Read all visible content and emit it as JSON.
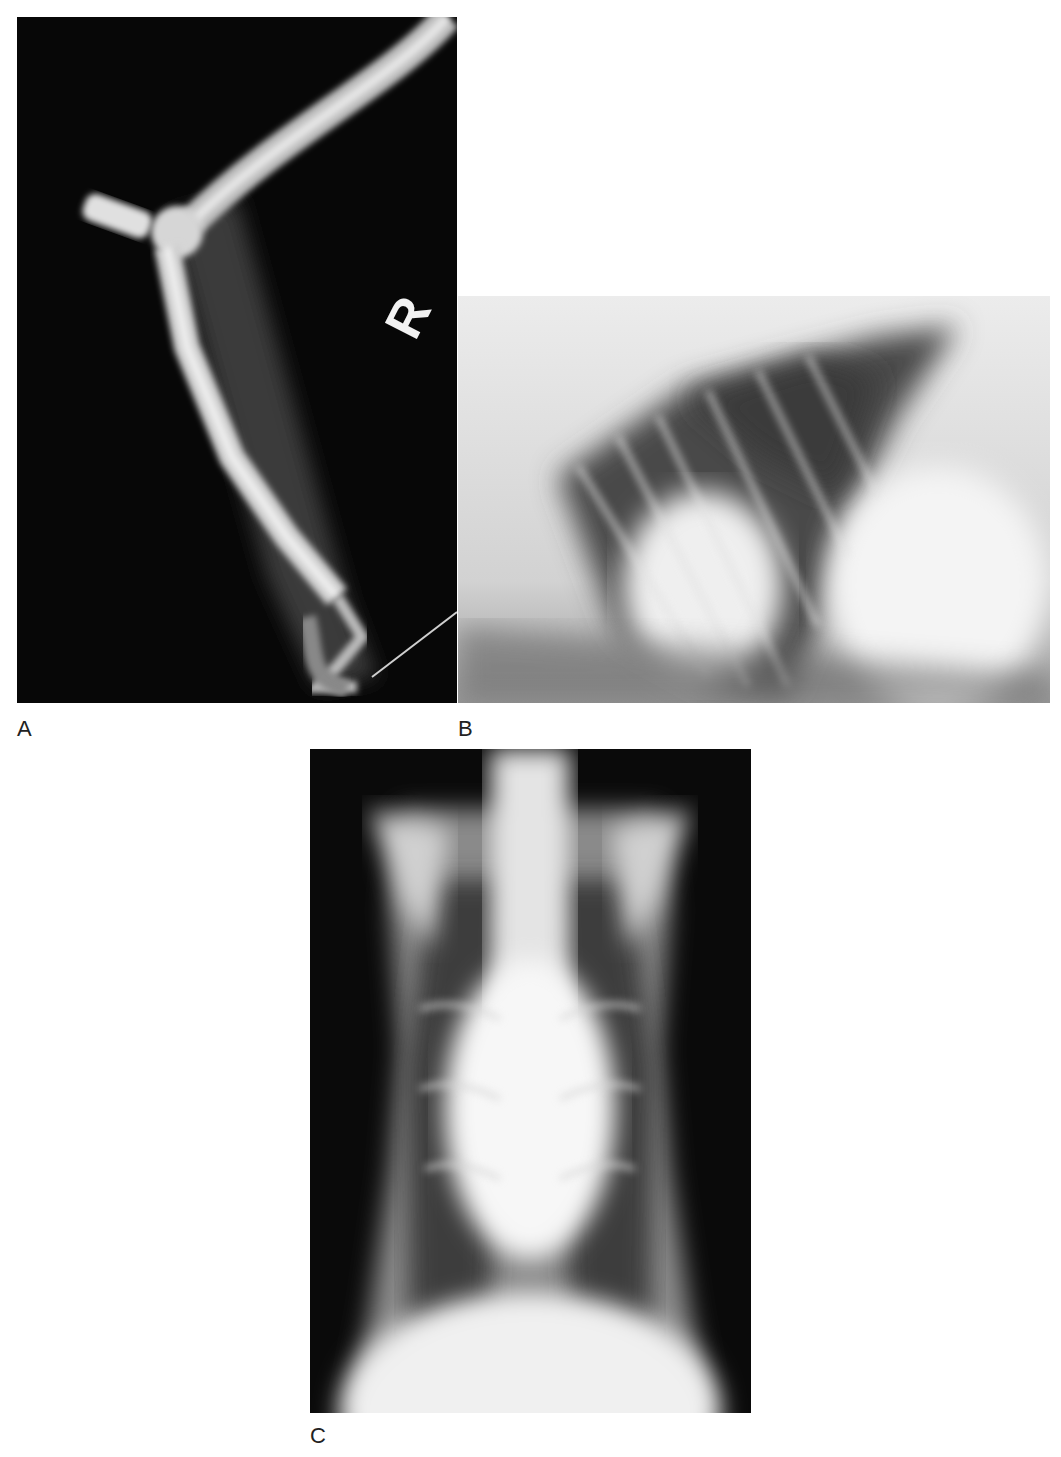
{
  "figure": {
    "panels": [
      {
        "id": "A",
        "label": "A",
        "content": "Lateral radiograph of limb (pelvic limb, bird)",
        "marker": "R"
      },
      {
        "id": "B",
        "label": "B",
        "content": "Lateral thoracic radiograph"
      },
      {
        "id": "C",
        "label": "C",
        "content": "Ventrodorsal thoracic radiograph"
      }
    ]
  }
}
